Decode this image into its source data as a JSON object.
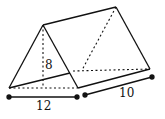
{
  "figure": {
    "type": "triangular-prism",
    "stroke_color": "#111111",
    "background": "#ffffff"
  },
  "labels": {
    "height": "8",
    "base_width": "12",
    "length": "10"
  }
}
